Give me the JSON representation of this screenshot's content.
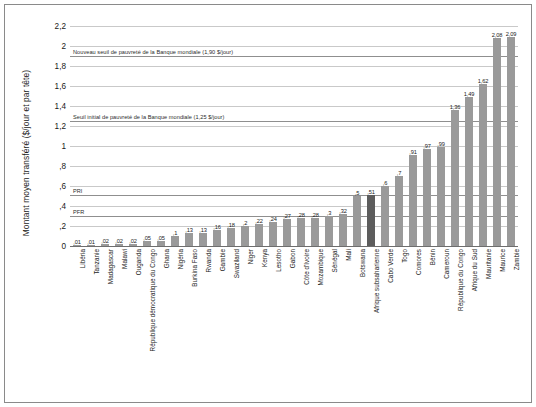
{
  "chart_data": {
    "type": "bar",
    "title": "",
    "xlabel": "",
    "ylabel": "Montant moyen transféré ($/jour et par tête)",
    "ylim": [
      0,
      2.3
    ],
    "yticks": [
      "0",
      ",2",
      ",4",
      ",6",
      ",8",
      "1",
      "1,2",
      "1,4",
      "1,6",
      "1,8",
      "2",
      "2,2"
    ],
    "ytick_values": [
      0,
      0.2,
      0.4,
      0.6,
      0.8,
      1.0,
      1.2,
      1.4,
      1.6,
      1.8,
      2.0,
      2.2
    ],
    "grid": true,
    "legend_position": "none",
    "highlight_category": "Afrique subsaharienne",
    "categories": [
      "Libéria",
      "Tanzanie",
      "Madagascar",
      "Malawi",
      "Ouganda",
      "République démocratique du Congo",
      "Ghana",
      "Nigéria",
      "Burkina Faso",
      "Rwanda",
      "Gambie",
      "Swaziland",
      "Niger",
      "Kenya",
      "Lesotho",
      "Gabon",
      "Côte d'Ivoire",
      "Mozambique",
      "Sénégal",
      "Mali",
      "Botswana",
      "Afrique subsaharienne",
      "Cabo Verde",
      "Togo",
      "Comores",
      "Bénin",
      "Cameroun",
      "République du Congo",
      "Afrique du Sud",
      "Mauritanie",
      "Maurice",
      "Zambie"
    ],
    "values": [
      0.01,
      0.01,
      0.02,
      0.02,
      0.02,
      0.05,
      0.05,
      0.1,
      0.13,
      0.13,
      0.16,
      0.18,
      0.2,
      0.22,
      0.24,
      0.27,
      0.28,
      0.28,
      0.3,
      0.32,
      0.5,
      0.51,
      0.6,
      0.7,
      0.91,
      0.97,
      0.99,
      1.36,
      1.49,
      1.62,
      2.08,
      2.09
    ],
    "value_labels": [
      ",01",
      ",01",
      ",02",
      ",02",
      ",02",
      ",05",
      ",05",
      ",1",
      ",13",
      ",13",
      ",16",
      ",18",
      ",2",
      ",22",
      ",24",
      ",27",
      ",28",
      ",28",
      ",3",
      ",32",
      ",5",
      ",51",
      ",6",
      ",7",
      ",91",
      ",97",
      ",99",
      "1,36",
      "1,49",
      "1,62",
      "2,08",
      "2,09"
    ],
    "reference_lines": [
      {
        "label": "Nouveau seuil de pauvreté de la Banque mondiale (1,90 $/jour)",
        "value": 1.9
      },
      {
        "label": "Seuil initial de pauvreté de la Banque mondiale (1,25 $/jour)",
        "value": 1.25
      },
      {
        "label": "PRI",
        "value": 0.51
      },
      {
        "label": "PFR",
        "value": 0.3
      }
    ],
    "colors": {
      "bar": "#9a9a9a",
      "bar_highlight": "#5d5d5d",
      "grid": "#c9c9c9",
      "axis": "#6e6e6e",
      "reference_line": "#8f8f8f",
      "text": "#1a1a1a",
      "background": "#ffffff",
      "frame": "#8a8a8a"
    }
  }
}
